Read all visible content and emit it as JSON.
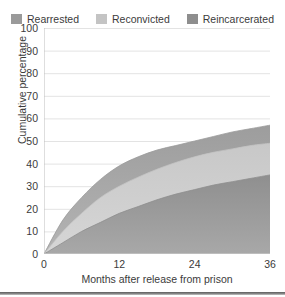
{
  "legend": {
    "position": "top-center",
    "items": [
      {
        "label": "Rearrested",
        "color": "#9a9a9a",
        "icon": "legend-swatch-icon"
      },
      {
        "label": "Reconvicted",
        "color": "#c4c4c4",
        "icon": "legend-swatch-icon"
      },
      {
        "label": "Reincarcerated",
        "color": "#8e8e8e",
        "icon": "legend-swatch-icon"
      }
    ]
  },
  "axes": {
    "y": {
      "label": "Cumulative percentage",
      "ticks": [
        "100",
        "90",
        "80",
        "70",
        "60",
        "50",
        "40",
        "30",
        "20",
        "10",
        "0"
      ]
    },
    "x": {
      "label": "Months after release from prison",
      "ticks": [
        "0",
        "12",
        "24",
        "36"
      ]
    }
  },
  "chart_data": {
    "type": "area",
    "title": "",
    "subtitle": "",
    "xlabel": "Months after release from prison",
    "ylabel": "Cumulative percentage",
    "xlim": [
      0,
      36
    ],
    "ylim": [
      0,
      100
    ],
    "xticks": [
      0,
      12,
      24,
      36
    ],
    "yticks": [
      0,
      10,
      20,
      30,
      40,
      50,
      60,
      70,
      80,
      90,
      100
    ],
    "grid": true,
    "grid_axis": "y",
    "legend": "top-center",
    "stacked": false,
    "overlapping": true,
    "x": [
      0,
      3,
      6,
      9,
      12,
      15,
      18,
      21,
      24,
      27,
      30,
      33,
      36
    ],
    "series": [
      {
        "name": "Rearrested",
        "color": "#9a9a9a",
        "values": [
          0,
          15,
          25,
          33,
          39,
          43,
          46,
          48,
          50,
          52,
          54,
          55.5,
          57
        ]
      },
      {
        "name": "Reconvicted",
        "color": "#c4c4c4",
        "values": [
          0,
          10,
          18,
          25,
          30,
          34,
          37.5,
          40.5,
          43,
          45,
          46.5,
          48,
          49
        ]
      },
      {
        "name": "Reincarcerated",
        "color": "#8e8e8e",
        "values": [
          0,
          5,
          10,
          14,
          18,
          21,
          24,
          26.5,
          28.5,
          30.5,
          32,
          33.5,
          35
        ]
      }
    ]
  },
  "colors": {
    "background": "#ffffff",
    "gridline": "#e3e3e3",
    "axis_line": "#bdbdbd",
    "text": "#3b3b3b",
    "bottom_rule": "#6e6e6e"
  }
}
